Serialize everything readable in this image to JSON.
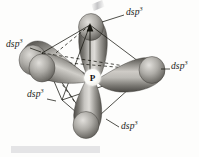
{
  "figure": {
    "kind": "orbital-hybridization-diagram",
    "geometry": "trigonal bipyramidal",
    "background_color": "#fdfdfc",
    "central_atom": {
      "symbol": "P",
      "name": "phosphorus",
      "x": 92,
      "y": 77
    },
    "labels": [
      {
        "id": "top-right",
        "base": "dsp",
        "exponent": "3",
        "x": 126,
        "y": 12,
        "align": "left"
      },
      {
        "id": "left-upper",
        "base": "dsp",
        "exponent": "3",
        "x": 6,
        "y": 44,
        "align": "left"
      },
      {
        "id": "right",
        "base": "dsp",
        "exponent": "3",
        "x": 170,
        "y": 65,
        "align": "left"
      },
      {
        "id": "left-lower",
        "base": "dsp",
        "exponent": "3",
        "x": 27,
        "y": 94,
        "align": "left"
      },
      {
        "id": "bottom-right",
        "base": "dsp",
        "exponent": "3",
        "x": 120,
        "y": 123,
        "align": "left"
      }
    ],
    "leader_lines": [
      {
        "id": "leader-top-right",
        "x1": 113,
        "y1": 17,
        "x2": 124,
        "y2": 15
      },
      {
        "id": "leader-left-upper",
        "x1": 40,
        "y1": 50,
        "x2": 30,
        "y2": 48
      },
      {
        "id": "leader-right",
        "x1": 160,
        "y1": 70,
        "x2": 169,
        "y2": 69
      },
      {
        "id": "leader-left-lower",
        "x1": 55,
        "y1": 101,
        "x2": 47,
        "y2": 99
      },
      {
        "id": "leader-bottom-right",
        "x1": 108,
        "y1": 119,
        "x2": 119,
        "y2": 127
      }
    ],
    "bottom_bar": {
      "color": "#e4e4e6",
      "x": 11,
      "y": 146,
      "width": 89,
      "height": 7
    },
    "lobes": [
      {
        "id": "lobe-top",
        "direction": "up"
      },
      {
        "id": "lobe-bottom",
        "direction": "down"
      },
      {
        "id": "lobe-left-rear",
        "direction": "left-rear"
      },
      {
        "id": "lobe-right-front",
        "direction": "right-front"
      },
      {
        "id": "lobe-left-front",
        "direction": "left-front"
      }
    ],
    "colors": {
      "lobe_light": "#d8d6d2",
      "lobe_mid": "#9a9893",
      "lobe_dark": "#55534f",
      "line": "#15150f",
      "text": "#1a1a1a"
    }
  }
}
